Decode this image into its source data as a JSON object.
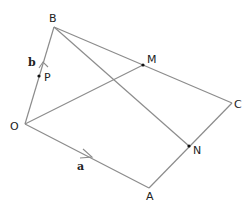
{
  "diagram": {
    "type": "vector-geometry",
    "points": {
      "O": {
        "label": "O",
        "x": 25,
        "y": 124
      },
      "A": {
        "label": "A",
        "x": 149,
        "y": 188
      },
      "B": {
        "label": "B",
        "x": 54,
        "y": 27
      },
      "C": {
        "label": "C",
        "x": 232,
        "y": 103
      },
      "M": {
        "label": "M",
        "x": 143,
        "y": 65
      },
      "N": {
        "label": "N",
        "x": 189,
        "y": 146
      },
      "P": {
        "label": "P",
        "x": 39,
        "y": 75
      }
    },
    "vectors": {
      "a": {
        "label": "a",
        "from": "O",
        "to": "A"
      },
      "b": {
        "label": "b",
        "from": "O",
        "to": "B"
      }
    },
    "segments": [
      "OB",
      "OA",
      "AC",
      "BC",
      "BN",
      "OM"
    ],
    "colors": {
      "line": "#8c8c8c",
      "text": "#222222",
      "dot": "#111111"
    }
  }
}
